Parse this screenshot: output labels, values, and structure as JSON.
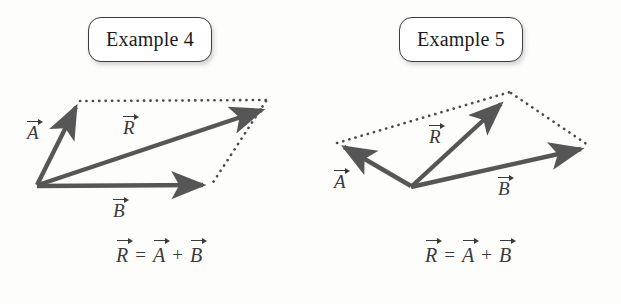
{
  "figure": {
    "background_color": "#fdfdfc",
    "ink_color": "#545454",
    "text_color": "#3a3a3a",
    "panels": [
      {
        "id": "example-4",
        "chip_label": "Example 4",
        "equation": {
          "lhs": "R",
          "eq": "=",
          "a": "A",
          "plus": "+",
          "b": "B"
        },
        "vector_labels": {
          "a": "A",
          "r": "R",
          "b": "B"
        },
        "description": "parallelogram addition, A up-right, B horizontal right, R diagonal",
        "geometry": {
          "origin": [
            37,
            185
          ],
          "a_tip": [
            79,
            102
          ],
          "b_tip": [
            209,
            184
          ],
          "r_tip": [
            268,
            106
          ],
          "parallelogram_corner": [
            80,
            101
          ]
        }
      },
      {
        "id": "example-5",
        "chip_label": "Example 5",
        "equation": {
          "lhs": "R",
          "eq": "=",
          "a": "A",
          "plus": "+",
          "b": "B"
        },
        "vector_labels": {
          "a": "A",
          "r": "R",
          "b": "B"
        },
        "description": "parallelogram addition, A up-left, B right, R steep up-right",
        "geometry": {
          "origin": [
            410,
            186
          ],
          "a_tip": [
            338,
            144
          ],
          "b_tip": [
            587,
            146
          ],
          "r_tip": [
            503,
            99
          ],
          "parallelogram_corner": [
            511,
            93
          ]
        }
      }
    ]
  }
}
